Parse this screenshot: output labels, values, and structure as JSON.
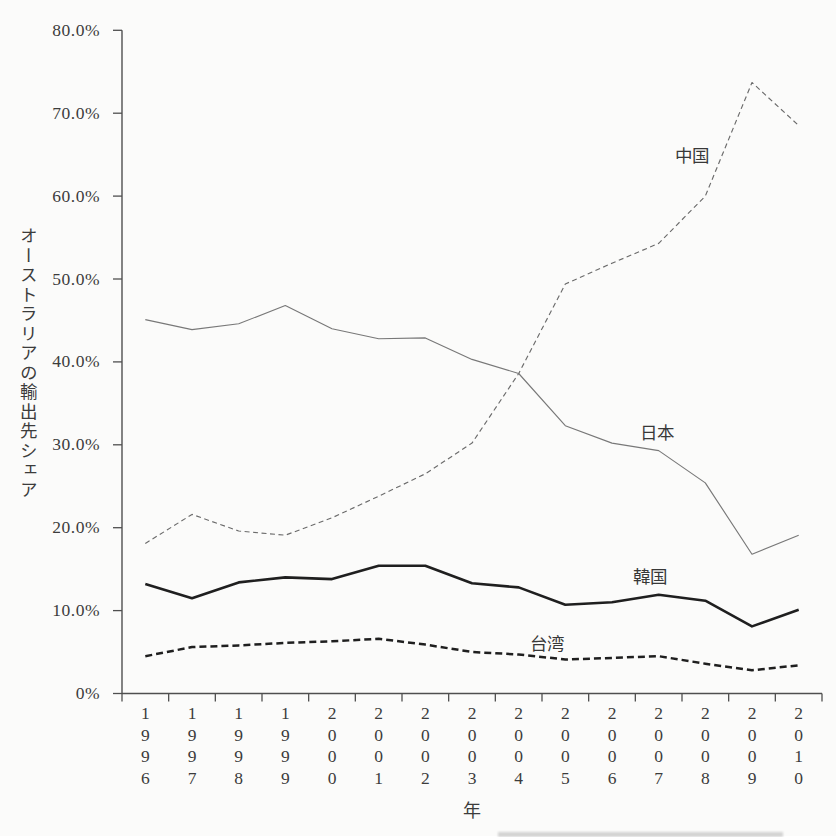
{
  "chart_data": {
    "type": "line",
    "title": "",
    "xlabel": "年",
    "ylabel": "オーストラリアの輸出先シェア",
    "x": [
      "1996",
      "1997",
      "1998",
      "1999",
      "2000",
      "2001",
      "2002",
      "2003",
      "2004",
      "2005",
      "2006",
      "2007",
      "2008",
      "2009",
      "2010"
    ],
    "ylim": [
      0,
      80
    ],
    "grid": false,
    "legend": "inline-annotations",
    "axis_color": "#4f4f4f",
    "yticks": [
      {
        "value": 0,
        "label": "0%"
      },
      {
        "value": 10,
        "label": "10.0%"
      },
      {
        "value": 20,
        "label": "20.0%"
      },
      {
        "value": 30,
        "label": "30.0%"
      },
      {
        "value": 40,
        "label": "40.0%"
      },
      {
        "value": 50,
        "label": "50.0%"
      },
      {
        "value": 60,
        "label": "60.0%"
      },
      {
        "value": 70,
        "label": "70.0%"
      },
      {
        "value": 80,
        "label": "80.0%"
      }
    ],
    "series": [
      {
        "id": "china",
        "name": "中国",
        "style": "dashed-thin",
        "color": "#6b6b6b",
        "values": [
          18.1,
          21.6,
          19.6,
          19.1,
          21.2,
          23.8,
          26.5,
          30.2,
          38.6,
          49.4,
          51.9,
          54.3,
          60.0,
          73.7,
          68.5
        ]
      },
      {
        "id": "japan",
        "name": "日本",
        "style": "solid-thin",
        "color": "#787878",
        "values": [
          45.1,
          43.9,
          44.6,
          46.8,
          44.0,
          42.8,
          42.9,
          40.3,
          38.6,
          32.3,
          30.2,
          29.3,
          25.4,
          16.8,
          19.1
        ]
      },
      {
        "id": "korea",
        "name": "韓国",
        "style": "solid-thick",
        "color": "#1f1f1f",
        "values": [
          13.2,
          11.5,
          13.4,
          14.0,
          13.8,
          15.4,
          15.4,
          13.3,
          12.8,
          10.7,
          11.0,
          11.9,
          11.2,
          8.1,
          10.1
        ]
      },
      {
        "id": "taiwan",
        "name": "台湾",
        "style": "dashed-thick",
        "color": "#1f1f1f",
        "values": [
          4.5,
          5.6,
          5.8,
          6.1,
          6.3,
          6.6,
          5.9,
          5.0,
          4.7,
          4.1,
          4.3,
          4.5,
          3.6,
          2.8,
          3.4
        ]
      }
    ],
    "annotations": [
      {
        "id": "china",
        "text": "中国",
        "x_px": 692,
        "y_px": 153
      },
      {
        "id": "japan",
        "text": "日本",
        "x_px": 657,
        "y_px": 430
      },
      {
        "id": "korea",
        "text": "韓国",
        "x_px": 650,
        "y_px": 574
      },
      {
        "id": "taiwan",
        "text": "台湾",
        "x_px": 547,
        "y_px": 641
      }
    ]
  }
}
